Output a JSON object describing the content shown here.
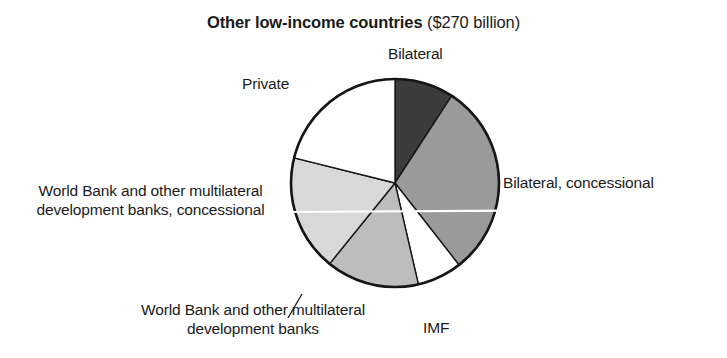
{
  "title": {
    "bold": "Other low-income countries",
    "regular": "($270 billion)"
  },
  "labels": {
    "bilateral": "Bilateral",
    "bilateral_concessional": "Bilateral, concessional",
    "imf": "IMF",
    "private": "Private",
    "world_bank_concessional": "World Bank and other multilateral development banks, concessional",
    "world_bank": "World Bank and other multilateral development banks"
  },
  "chart_data": {
    "type": "pie",
    "title": "Other low-income countries ($270 billion)",
    "total_label": "$270 billion",
    "total_value": 270,
    "units": "billion USD",
    "legend": "labels placed around pie with leader lines",
    "start_angle_deg": 0,
    "direction": "clockwise",
    "categories": [
      "Bilateral",
      "Bilateral, concessional",
      "IMF",
      "World Bank and other multilateral development banks",
      "World Bank and other multilateral development banks, concessional",
      "Private"
    ],
    "slices": [
      {
        "label": "Bilateral",
        "start_deg": 0,
        "end_deg": 33,
        "sweep_deg": 33,
        "percent": 9.2,
        "value": 24.8,
        "fill": "#3b3b3b",
        "stroke": "#161616"
      },
      {
        "label": "Bilateral, concessional",
        "start_deg": 33,
        "end_deg": 142,
        "sweep_deg": 109,
        "percent": 30.3,
        "value": 81.8,
        "fill": "#9a9a9a",
        "stroke": "#161616"
      },
      {
        "label": "IMF",
        "start_deg": 142,
        "end_deg": 167,
        "sweep_deg": 25,
        "percent": 6.9,
        "value": 18.8,
        "fill": "#ffffff",
        "stroke": "#161616"
      },
      {
        "label": "World Bank and other multilateral development banks",
        "start_deg": 167,
        "end_deg": 219,
        "sweep_deg": 52,
        "percent": 14.4,
        "value": 39.0,
        "fill": "#bdbdbd",
        "stroke": "#161616"
      },
      {
        "label": "World Bank and other multilateral development banks, concessional",
        "start_deg": 219,
        "end_deg": 284,
        "sweep_deg": 65,
        "percent": 18.1,
        "value": 48.8,
        "fill": "#d8d8d8",
        "stroke": "#161616"
      },
      {
        "label": "Private",
        "start_deg": 284,
        "end_deg": 360,
        "sweep_deg": 76,
        "percent": 21.1,
        "value": 57.0,
        "fill": "#ffffff",
        "stroke": "#161616"
      }
    ],
    "geometry": {
      "cx": 395,
      "cy": 183,
      "r": 104
    },
    "colors": {
      "outline": "#161616",
      "background": "#ffffff",
      "text": "#1a1a1a"
    }
  }
}
